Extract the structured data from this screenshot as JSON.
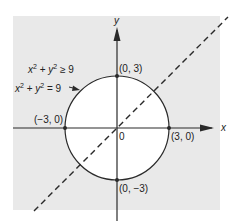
{
  "figure": {
    "colors": {
      "shade": "#e9e9e9",
      "background": "#ffffff",
      "line": "#2a2a2a",
      "circle_fill": "#ffffff"
    },
    "region_label": {
      "text_x": "x",
      "sup1": "2",
      "plus": " + ",
      "text_y": "y",
      "sup2": "2",
      "rel": " ≥ 9"
    },
    "circle_label": {
      "text_x": "x",
      "sup1": "2",
      "plus": " + ",
      "text_y": "y",
      "sup2": "2",
      "rel": " = 9"
    },
    "axes": {
      "x_label": "x",
      "y_label": "y",
      "origin_label": "0"
    },
    "points": [
      {
        "label": "(0, 3)",
        "x": 0,
        "y": 3
      },
      {
        "label": "(−3, 0)",
        "x": -3,
        "y": 0
      },
      {
        "label": "(3, 0)",
        "x": 3,
        "y": 0
      },
      {
        "label": "(0, −3)",
        "x": 0,
        "y": -3
      }
    ],
    "circle": {
      "equation": "x^2 + y^2 = 9",
      "center": [
        0,
        0
      ],
      "radius": 3
    },
    "dashed_line": {
      "description": "line y = x",
      "style": "dashed"
    }
  }
}
